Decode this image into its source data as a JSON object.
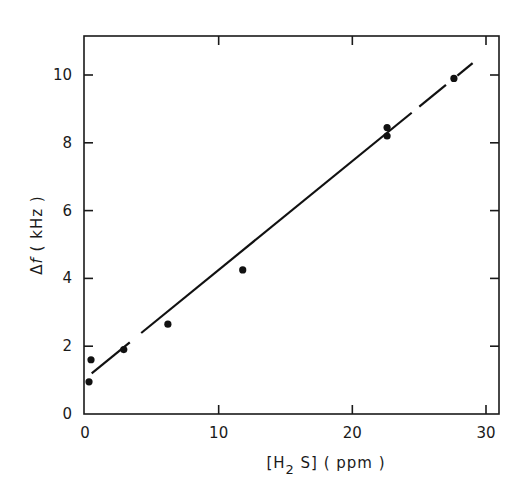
{
  "chart_data": {
    "type": "scatter",
    "title": "",
    "xlabel": "[H2S] (ppm)",
    "ylabel": "Δf (kHz)",
    "xlim": [
      0,
      31
    ],
    "ylim": [
      0,
      11
    ],
    "xticks": [
      0,
      10,
      20,
      30
    ],
    "yticks": [
      0,
      2,
      4,
      6,
      8,
      10
    ],
    "grid": false,
    "legend": null,
    "series": [
      {
        "name": "measured",
        "kind": "scatter",
        "points": [
          {
            "x": 0.3,
            "y": 0.95
          },
          {
            "x": 0.45,
            "y": 1.6
          },
          {
            "x": 2.9,
            "y": 1.9
          },
          {
            "x": 6.2,
            "y": 2.65
          },
          {
            "x": 11.8,
            "y": 4.25
          },
          {
            "x": 22.6,
            "y": 8.2
          },
          {
            "x": 22.6,
            "y": 8.45
          },
          {
            "x": 27.6,
            "y": 9.9
          }
        ]
      },
      {
        "name": "linear fit",
        "kind": "line",
        "points": [
          {
            "x": 0.5,
            "y": 1.2
          },
          {
            "x": 29.0,
            "y": 10.35
          }
        ]
      }
    ]
  },
  "labels": {
    "xaxis": {
      "prefix": "[H",
      "sub": "2",
      "suffix": " S] ( ppm )"
    },
    "yaxis": {
      "delta": "Δ",
      "f": "f",
      "unit": " ( kHz )"
    },
    "xticks": [
      "0",
      "10",
      "20",
      "30"
    ],
    "yticks": [
      "0",
      "2",
      "4",
      "6",
      "8",
      "10"
    ]
  }
}
